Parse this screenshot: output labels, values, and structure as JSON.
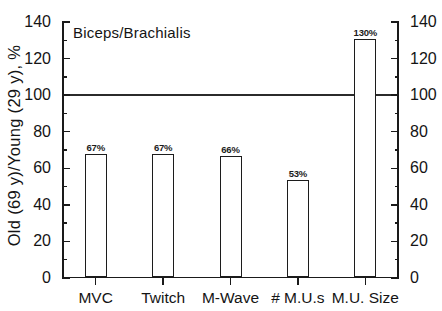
{
  "chart_data": {
    "type": "bar",
    "title": "Biceps/Brachialis",
    "xlabel": "",
    "ylabel": "Old (69 y)/Young (29 y), %",
    "categories": [
      "MVC",
      "Twitch",
      "M-Wave",
      "# M.U.s",
      "M.U. Size"
    ],
    "values": [
      67,
      67,
      66,
      53,
      130
    ],
    "value_labels": [
      "67%",
      "67%",
      "66%",
      "53%",
      "130%"
    ],
    "ylim": [
      0,
      140
    ],
    "ytick_major": [
      0,
      20,
      40,
      60,
      80,
      100,
      120,
      140
    ],
    "ytick_major_labels": [
      "0",
      "20",
      "40",
      "60",
      "80",
      "100",
      "120",
      "140"
    ],
    "ytick_minor": [
      10,
      30,
      50,
      70,
      90,
      110,
      130
    ],
    "grid": false,
    "legend": null,
    "legend_position": "none",
    "right_axis": {
      "mirrored": true,
      "ylim": [
        0,
        140
      ],
      "ytick_major_labels": [
        "0",
        "20",
        "40",
        "60",
        "80",
        "100",
        "120",
        "140"
      ]
    },
    "annotations": [
      {
        "type": "hline",
        "y": 100,
        "label": ""
      }
    ],
    "bar_style": {
      "fill": "#ffffff",
      "edge": "#1c1c1c"
    }
  }
}
